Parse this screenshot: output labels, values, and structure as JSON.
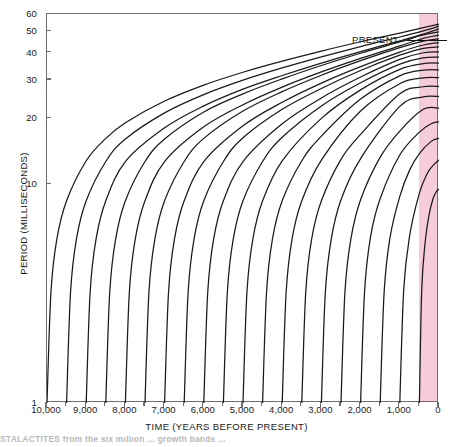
{
  "figure": {
    "title": "",
    "present_label": "PRESENT",
    "caption_partial": "STALACTITES  from  the  six  million  ... growth  bands  ..."
  },
  "axes": {
    "y": {
      "title": "PERIOD (MILLISECONDS)",
      "scale": "log",
      "ticks": [
        1,
        10,
        20,
        30,
        40,
        50,
        60
      ],
      "tick_labels": [
        "1",
        "10",
        "20",
        "30",
        "40",
        "50",
        "60"
      ],
      "min": 1,
      "max": 60
    },
    "x": {
      "title": "TIME (YEARS BEFORE PRESENT)",
      "scale": "linear",
      "reversed": true,
      "ticks": [
        10000,
        9000,
        8000,
        7000,
        6000,
        5000,
        4000,
        3000,
        2000,
        1000,
        0
      ],
      "tick_labels": [
        "10,000",
        "9,000",
        "8,000",
        "7,000",
        "6,000",
        "5,000",
        "4,000",
        "3,000",
        "2,000",
        "1,000",
        "0"
      ],
      "minor_tick_step": 500,
      "min": 0,
      "max": 10000
    }
  },
  "colors": {
    "curve": "#1a1a1a",
    "frame": "#6e6e6e",
    "present_band": "#f6c3d4",
    "text": "#1a1a1a"
  },
  "chart_data": {
    "type": "line",
    "title": "",
    "xlabel": "TIME (YEARS BEFORE PRESENT)",
    "ylabel": "PERIOD (MILLISECONDS)",
    "xlim": [
      10000,
      0
    ],
    "ylim": [
      1,
      60
    ],
    "yscale": "log",
    "grid": false,
    "legend": false,
    "annotations": [
      {
        "text": "PRESENT",
        "x": 300,
        "y": 56,
        "leader_to_x": 150
      }
    ],
    "present_band": {
      "from_x": 420,
      "to_x": 0,
      "color": "#f6c3d4"
    },
    "series_description": "Each curve begins at a period of 1 millisecond at its own origin year (spaced every 500 years from 10,000 to 500 years before present) and rises toward the present; earlier-starting curves reach higher final periods.",
    "series": [
      {
        "name": "origin-10000",
        "origin_year": 10000,
        "final_period": 54.0,
        "x": [
          10000,
          9900,
          9750,
          9500,
          9000,
          8500,
          8000,
          7000,
          6000,
          5000,
          4000,
          3000,
          2000,
          1000,
          400,
          0
        ],
        "values": [
          1.0,
          3.2,
          5.6,
          8.4,
          12.8,
          16.2,
          19.1,
          24.0,
          28.4,
          32.5,
          36.5,
          40.6,
          44.8,
          49.1,
          52.0,
          54.0
        ]
      },
      {
        "name": "origin-9500",
        "origin_year": 9500,
        "final_period": 52.8,
        "x": [
          9500,
          9400,
          9250,
          9000,
          8500,
          8000,
          7000,
          6000,
          5000,
          4000,
          3000,
          2000,
          1000,
          400,
          0
        ],
        "values": [
          1.0,
          3.2,
          5.6,
          8.4,
          12.7,
          16.1,
          21.2,
          25.7,
          29.9,
          34.0,
          38.2,
          42.6,
          47.1,
          50.2,
          52.8
        ]
      },
      {
        "name": "origin-9000",
        "origin_year": 9000,
        "final_period": 51.3,
        "x": [
          9000,
          8900,
          8750,
          8500,
          8000,
          7000,
          6000,
          5000,
          4000,
          3000,
          2000,
          1000,
          400,
          0
        ],
        "values": [
          1.0,
          3.2,
          5.6,
          8.4,
          12.7,
          18.1,
          22.8,
          27.2,
          31.4,
          35.8,
          40.4,
          45.2,
          48.5,
          51.3
        ]
      },
      {
        "name": "origin-8500",
        "origin_year": 8500,
        "final_period": 49.7,
        "x": [
          8500,
          8400,
          8250,
          8000,
          7500,
          7000,
          6000,
          5000,
          4000,
          3000,
          2000,
          1000,
          400,
          0
        ],
        "values": [
          1.0,
          3.2,
          5.6,
          8.4,
          12.7,
          16.1,
          21.4,
          25.9,
          30.3,
          34.9,
          39.7,
          44.7,
          48.1,
          49.7
        ]
      },
      {
        "name": "origin-8000",
        "origin_year": 8000,
        "final_period": 48.0,
        "x": [
          8000,
          7900,
          7750,
          7500,
          7000,
          6000,
          5000,
          4000,
          3000,
          2000,
          1000,
          400,
          0
        ],
        "values": [
          1.0,
          3.2,
          5.6,
          8.4,
          12.7,
          18.3,
          23.1,
          27.8,
          32.6,
          37.6,
          42.9,
          46.4,
          48.0
        ]
      },
      {
        "name": "origin-7500",
        "origin_year": 7500,
        "final_period": 46.2,
        "x": [
          7500,
          7400,
          7250,
          7000,
          6500,
          6000,
          5000,
          4000,
          3000,
          2000,
          1000,
          400,
          0
        ],
        "values": [
          1.0,
          3.2,
          5.6,
          8.4,
          12.7,
          16.2,
          21.6,
          26.5,
          31.5,
          36.7,
          42.1,
          45.1,
          46.2
        ]
      },
      {
        "name": "origin-7000",
        "origin_year": 7000,
        "final_period": 44.4,
        "x": [
          7000,
          6900,
          6750,
          6500,
          6000,
          5000,
          4000,
          3000,
          2000,
          1000,
          400,
          0
        ],
        "values": [
          1.0,
          3.2,
          5.6,
          8.4,
          12.7,
          18.5,
          23.7,
          29.0,
          34.5,
          40.2,
          43.3,
          44.4
        ]
      },
      {
        "name": "origin-6500",
        "origin_year": 6500,
        "final_period": 42.4,
        "x": [
          6500,
          6400,
          6250,
          6000,
          5500,
          5000,
          4000,
          3000,
          2000,
          1000,
          400,
          0
        ],
        "values": [
          1.0,
          3.2,
          5.6,
          8.4,
          12.7,
          16.3,
          22.0,
          27.4,
          33.1,
          38.9,
          41.8,
          42.4
        ]
      },
      {
        "name": "origin-6000",
        "origin_year": 6000,
        "final_period": 40.3,
        "x": [
          6000,
          5900,
          5750,
          5500,
          5000,
          4000,
          3000,
          2000,
          1000,
          400,
          0
        ],
        "values": [
          1.0,
          3.2,
          5.6,
          8.4,
          12.7,
          18.9,
          24.8,
          30.9,
          37.2,
          39.9,
          40.3
        ]
      },
      {
        "name": "origin-5500",
        "origin_year": 5500,
        "final_period": 38.1,
        "x": [
          5500,
          5400,
          5250,
          5000,
          4500,
          4000,
          3000,
          2000,
          1000,
          400,
          0
        ],
        "values": [
          1.0,
          3.2,
          5.6,
          8.4,
          12.7,
          16.4,
          22.8,
          29.1,
          35.4,
          37.8,
          38.1
        ]
      },
      {
        "name": "origin-5000",
        "origin_year": 5000,
        "final_period": 35.8,
        "x": [
          5000,
          4900,
          4750,
          4500,
          4000,
          3000,
          2000,
          1000,
          400,
          0
        ],
        "values": [
          1.0,
          3.2,
          5.6,
          8.4,
          12.8,
          20.0,
          27.0,
          33.5,
          35.6,
          35.8
        ]
      },
      {
        "name": "origin-4500",
        "origin_year": 4500,
        "final_period": 33.3,
        "x": [
          4500,
          4400,
          4250,
          4000,
          3500,
          3000,
          2000,
          1000,
          400,
          0
        ],
        "values": [
          1.0,
          3.2,
          5.6,
          8.4,
          12.8,
          16.6,
          24.5,
          31.3,
          33.2,
          33.3
        ]
      },
      {
        "name": "origin-4000",
        "origin_year": 4000,
        "final_period": 30.7,
        "x": [
          4000,
          3900,
          3750,
          3500,
          3000,
          2000,
          1000,
          400,
          0
        ],
        "values": [
          1.0,
          3.2,
          5.6,
          8.4,
          12.9,
          21.6,
          28.8,
          30.6,
          30.7
        ]
      },
      {
        "name": "origin-3500",
        "origin_year": 3500,
        "final_period": 28.0,
        "x": [
          3500,
          3400,
          3250,
          3000,
          2500,
          2000,
          1000,
          400,
          0
        ],
        "values": [
          1.0,
          3.2,
          5.6,
          8.4,
          13.0,
          16.9,
          25.9,
          27.9,
          28.0
        ]
      },
      {
        "name": "origin-3000",
        "origin_year": 3000,
        "final_period": 25.2,
        "x": [
          3000,
          2900,
          2750,
          2500,
          2000,
          1000,
          400,
          0
        ],
        "values": [
          1.0,
          3.2,
          5.6,
          8.5,
          13.1,
          22.7,
          25.1,
          25.2
        ]
      },
      {
        "name": "origin-2500",
        "origin_year": 2500,
        "final_period": 22.3,
        "x": [
          2500,
          2400,
          2250,
          2000,
          1500,
          1000,
          400,
          0
        ],
        "values": [
          1.0,
          3.2,
          5.6,
          8.5,
          13.3,
          17.5,
          22.0,
          22.3
        ]
      },
      {
        "name": "origin-2000",
        "origin_year": 2000,
        "final_period": 19.3,
        "x": [
          2000,
          1900,
          1750,
          1500,
          1000,
          500,
          200,
          0
        ],
        "values": [
          1.0,
          3.2,
          5.7,
          8.6,
          13.6,
          17.3,
          18.9,
          19.3
        ]
      },
      {
        "name": "origin-1500",
        "origin_year": 1500,
        "final_period": 16.2,
        "x": [
          1500,
          1400,
          1250,
          1000,
          750,
          500,
          200,
          0
        ],
        "values": [
          1.0,
          3.2,
          5.7,
          8.8,
          11.6,
          13.8,
          15.7,
          16.2
        ]
      },
      {
        "name": "origin-1000",
        "origin_year": 1000,
        "final_period": 12.9,
        "x": [
          1000,
          900,
          750,
          500,
          300,
          150,
          0
        ],
        "values": [
          1.0,
          3.3,
          5.8,
          9.1,
          11.2,
          12.2,
          12.9
        ]
      },
      {
        "name": "origin-500",
        "origin_year": 500,
        "final_period": 9.5,
        "x": [
          500,
          440,
          350,
          250,
          150,
          60,
          0
        ],
        "values": [
          1.0,
          3.3,
          5.5,
          7.3,
          8.6,
          9.3,
          9.5
        ]
      }
    ]
  }
}
